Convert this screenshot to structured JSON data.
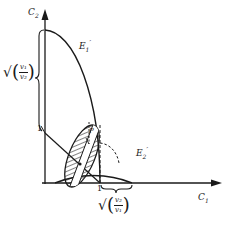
{
  "axes": {
    "x_label": "C",
    "x_sub": "1",
    "y_label": "C",
    "y_sub": "2"
  },
  "curves": {
    "e1": {
      "label": "E",
      "sub": "1",
      "prime": "′"
    },
    "e2": {
      "label": "E",
      "sub": "2",
      "prime": "′"
    }
  },
  "ticks": {
    "y_one": "1",
    "x_one": "1"
  },
  "point": {
    "label": "P"
  },
  "brace_y": {
    "radical": "√",
    "num": "v₁",
    "den": "v₂"
  },
  "brace_x": {
    "radical": "√",
    "num": "v₂",
    "den": "v₁"
  },
  "colors": {
    "ink": "#1a1a1a",
    "background": "#ffffff"
  }
}
